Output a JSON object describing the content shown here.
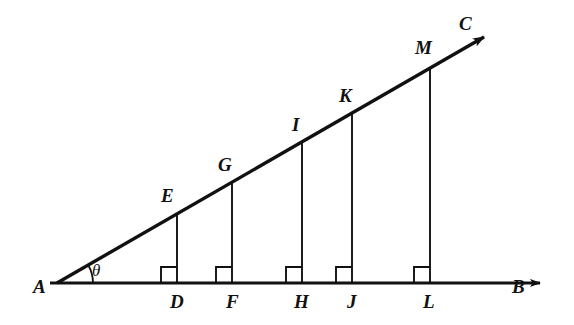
{
  "figure": {
    "kind": "geometry-diagram",
    "width": 574,
    "height": 325,
    "background_color": "#ffffff",
    "stroke_color": "#111111",
    "description_labels_total": 14
  },
  "geometry": {
    "apex": {
      "name": "A",
      "x": 57,
      "y": 283
    },
    "baseline": {
      "name": "AB",
      "from_x": 50,
      "from_y": 283,
      "to_x": 545,
      "to_y": 283,
      "arrow": "right",
      "stroke_width": 3.2
    },
    "ray": {
      "name": "AC",
      "from_x": 57,
      "from_y": 283,
      "to_x": 491,
      "to_y": 33,
      "arrow": "end",
      "stroke_width": 3.2
    },
    "angle_arc": {
      "label": "θ",
      "center_x": 57,
      "center_y": 283,
      "radius": 36,
      "start_deg": 0,
      "end_deg": 30
    },
    "perpendiculars": [
      {
        "foot": "D",
        "top": "E",
        "x": 177,
        "base_y": 283,
        "top_y": 213
      },
      {
        "foot": "F",
        "top": "G",
        "x": 232,
        "base_y": 283,
        "top_y": 182
      },
      {
        "foot": "H",
        "top": "I",
        "x": 302,
        "base_y": 283,
        "top_y": 142
      },
      {
        "foot": "J",
        "top": "K",
        "x": 352,
        "base_y": 283,
        "top_y": 113
      },
      {
        "foot": "L",
        "top": "M",
        "x": 430,
        "base_y": 283,
        "top_y": 68
      }
    ],
    "right_angle_marks": {
      "size": 16,
      "side": "left-of-vertical",
      "count": 5
    }
  },
  "labels": {
    "apex": {
      "text": "A",
      "x": 33,
      "y": 277
    },
    "base_end": {
      "text": "B",
      "x": 512,
      "y": 277
    },
    "ray_end": {
      "text": "C",
      "x": 459,
      "y": 14
    },
    "angle": {
      "text": "θ",
      "x": 92,
      "y": 262
    },
    "feet": [
      {
        "text": "D",
        "x": 170,
        "y": 292
      },
      {
        "text": "F",
        "x": 226,
        "y": 292
      },
      {
        "text": "H",
        "x": 294,
        "y": 292
      },
      {
        "text": "J",
        "x": 347,
        "y": 292
      },
      {
        "text": "L",
        "x": 423,
        "y": 292
      }
    ],
    "tops": [
      {
        "text": "E",
        "x": 161,
        "y": 186
      },
      {
        "text": "G",
        "x": 218,
        "y": 155
      },
      {
        "text": "I",
        "x": 292,
        "y": 115
      },
      {
        "text": "K",
        "x": 339,
        "y": 86
      },
      {
        "text": "M",
        "x": 415,
        "y": 38
      }
    ]
  }
}
